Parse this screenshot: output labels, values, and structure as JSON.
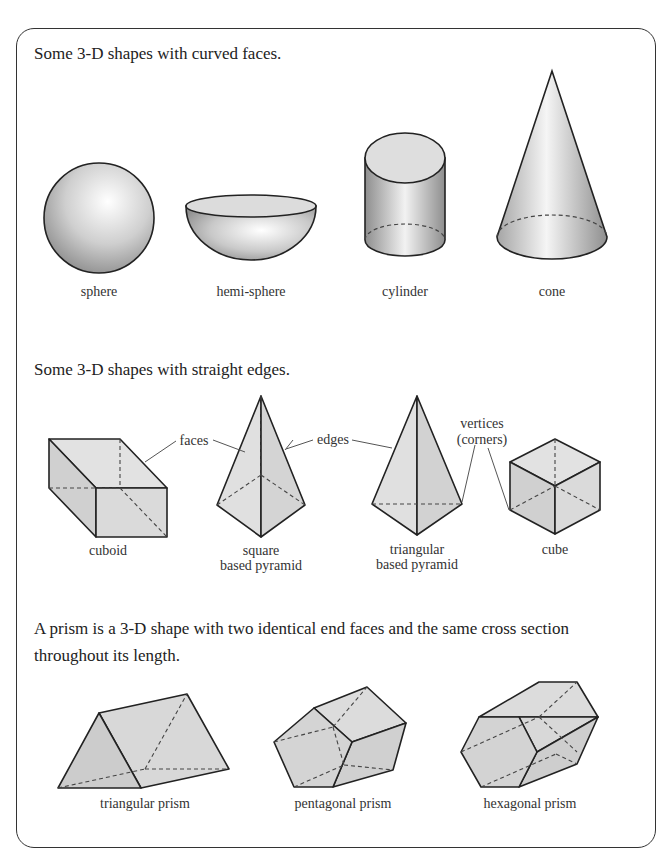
{
  "sections": {
    "curved": {
      "heading": "Some 3-D shapes with curved faces.",
      "shapes": [
        {
          "name": "sphere",
          "label": "sphere"
        },
        {
          "name": "hemi-sphere",
          "label": "hemi-sphere"
        },
        {
          "name": "cylinder",
          "label": "cylinder"
        },
        {
          "name": "cone",
          "label": "cone"
        }
      ]
    },
    "straight": {
      "heading": "Some 3-D shapes with straight edges.",
      "shapes": [
        {
          "name": "cuboid",
          "label": "cuboid"
        },
        {
          "name": "square-based-pyramid",
          "label_line1": "square",
          "label_line2": "based pyramid"
        },
        {
          "name": "triangular-based-pyramid",
          "label_line1": "triangular",
          "label_line2": "based pyramid"
        },
        {
          "name": "cube",
          "label": "cube"
        }
      ],
      "annotations": {
        "faces": "faces",
        "edges": "edges",
        "vertices_line1": "vertices",
        "vertices_line2": "(corners)"
      }
    },
    "prisms": {
      "heading": "A prism is a 3-D shape with two identical end faces and the same cross section throughout its length.",
      "shapes": [
        {
          "name": "triangular-prism",
          "label": "triangular prism"
        },
        {
          "name": "pentagonal-prism",
          "label": "pentagonal prism"
        },
        {
          "name": "hexagonal-prism",
          "label": "hexagonal prism"
        }
      ]
    }
  },
  "colors": {
    "outline": "#222222",
    "face_light": "#e4e4e4",
    "face_mid": "#d6d6d6",
    "face_dark": "#c8c8c8",
    "frame": "#333333"
  }
}
